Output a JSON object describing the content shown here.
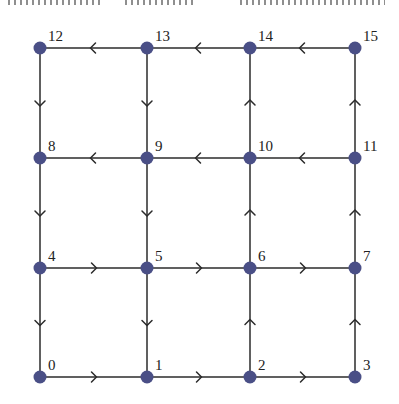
{
  "diagram": {
    "type": "directed-grid-graph",
    "rows": 4,
    "cols": 4,
    "colors": {
      "node": "#4a4f86",
      "edge": "#2b2b2b",
      "label": "#222222"
    },
    "nodes": [
      {
        "id": "0",
        "label": "0",
        "x": 40,
        "y": 377
      },
      {
        "id": "1",
        "label": "1",
        "x": 147,
        "y": 377
      },
      {
        "id": "2",
        "label": "2",
        "x": 250,
        "y": 377
      },
      {
        "id": "3",
        "label": "3",
        "x": 355,
        "y": 377
      },
      {
        "id": "4",
        "label": "4",
        "x": 40,
        "y": 268
      },
      {
        "id": "5",
        "label": "5",
        "x": 147,
        "y": 268
      },
      {
        "id": "6",
        "label": "6",
        "x": 250,
        "y": 268
      },
      {
        "id": "7",
        "label": "7",
        "x": 355,
        "y": 268
      },
      {
        "id": "8",
        "label": "8",
        "x": 40,
        "y": 158
      },
      {
        "id": "9",
        "label": "9",
        "x": 147,
        "y": 158
      },
      {
        "id": "10",
        "label": "10",
        "x": 250,
        "y": 158
      },
      {
        "id": "11",
        "label": "11",
        "x": 355,
        "y": 158
      },
      {
        "id": "12",
        "label": "12",
        "x": 40,
        "y": 48
      },
      {
        "id": "13",
        "label": "13",
        "x": 147,
        "y": 48
      },
      {
        "id": "14",
        "label": "14",
        "x": 250,
        "y": 48
      },
      {
        "id": "15",
        "label": "15",
        "x": 355,
        "y": 48
      }
    ],
    "edges": [
      {
        "from": "13",
        "to": "12"
      },
      {
        "from": "14",
        "to": "13"
      },
      {
        "from": "15",
        "to": "14"
      },
      {
        "from": "9",
        "to": "8"
      },
      {
        "from": "10",
        "to": "9"
      },
      {
        "from": "11",
        "to": "10"
      },
      {
        "from": "4",
        "to": "5"
      },
      {
        "from": "5",
        "to": "6"
      },
      {
        "from": "6",
        "to": "7"
      },
      {
        "from": "0",
        "to": "1"
      },
      {
        "from": "1",
        "to": "2"
      },
      {
        "from": "2",
        "to": "3"
      },
      {
        "from": "12",
        "to": "8"
      },
      {
        "from": "8",
        "to": "4"
      },
      {
        "from": "4",
        "to": "0"
      },
      {
        "from": "13",
        "to": "9"
      },
      {
        "from": "9",
        "to": "5"
      },
      {
        "from": "5",
        "to": "1"
      },
      {
        "from": "2",
        "to": "6"
      },
      {
        "from": "6",
        "to": "10"
      },
      {
        "from": "10",
        "to": "14"
      },
      {
        "from": "3",
        "to": "7"
      },
      {
        "from": "7",
        "to": "11"
      },
      {
        "from": "11",
        "to": "15"
      }
    ]
  }
}
